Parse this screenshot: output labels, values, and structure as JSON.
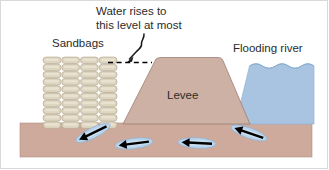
{
  "figure": {
    "labels": {
      "callout_line1": "Water rises to",
      "callout_line2": "this level at most",
      "sandbags": "Sandbags",
      "levee": "Levee",
      "river": "Flooding river"
    },
    "colors": {
      "background": "#ffffff",
      "ground": "#ceaa9c",
      "levee": "#cdb1a4",
      "levee_outline": "#9c7f73",
      "water": "#a8c4e0",
      "water_edge": "#8fb3d6",
      "sandbag_fill": "#ded5c0",
      "sandbag_highlight": "#ebe4d4",
      "sandbag_outline": "#a89c84",
      "arrow_halo": "#b9d3ea",
      "arrow": "#000000",
      "text": "#2b2b2b",
      "dashed_line": "#000000"
    },
    "elements": {
      "ground_layer": {
        "x": 20,
        "y": 123,
        "width": 292,
        "height": 34
      },
      "levee": {
        "base_left": 123,
        "base_right": 250,
        "top_left": 156,
        "top_right": 222,
        "top_y": 58,
        "base_y": 124
      },
      "water_surface_y": 66,
      "dashed_level_y": 62,
      "dashed_from_x": 108,
      "dashed_to_x": 150,
      "sandbag_wall": {
        "x": 43,
        "y": 57,
        "columns": 4,
        "rows": 10,
        "bag_width": 18,
        "bag_height": 6.6
      },
      "seepage_arrows": [
        {
          "id": "arrow-1",
          "cx": 93,
          "cy": 133,
          "rotation": -26,
          "length": 34
        },
        {
          "id": "arrow-2",
          "cx": 133,
          "cy": 143,
          "rotation": -8,
          "length": 37
        },
        {
          "id": "arrow-3",
          "cx": 196,
          "cy": 143,
          "rotation": 3,
          "length": 37
        },
        {
          "id": "arrow-4",
          "cx": 248,
          "cy": 133,
          "rotation": 18,
          "length": 34
        }
      ],
      "arrow_direction": "leftward (river seeps under the levee toward the protected side)"
    }
  }
}
